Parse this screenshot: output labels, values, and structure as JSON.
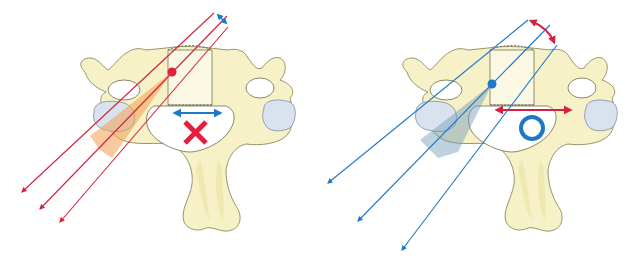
{
  "figure": {
    "panels": [
      {
        "id": "left",
        "entry_point_color": "#e0203c",
        "trajectory_color": "#d4213d",
        "trajectory_count": 3,
        "angle_arrow_color": "#1e78c8",
        "canal_arrow_color": "#1e78c8",
        "zone_color": "#f0a050",
        "result_symbol": "✕",
        "result_symbol_name": "cross-mark",
        "result_color": "#e0203c",
        "meaning": "narrow angular variation - incorrect"
      },
      {
        "id": "right",
        "entry_point_color": "#1e78c8",
        "trajectory_color": "#1e78c8",
        "trajectory_count": 3,
        "angle_arrow_color": "#d4213d",
        "canal_arrow_color": "#d4213d",
        "zone_color": "#6e9ab8",
        "result_symbol": "○",
        "result_symbol_name": "circle-mark",
        "result_color": "#1e78c8",
        "meaning": "wide angular variation - correct"
      }
    ]
  }
}
